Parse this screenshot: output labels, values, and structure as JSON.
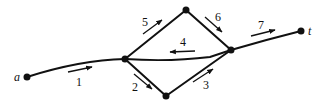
{
  "diagram": {
    "type": "directed network graph",
    "nodes": [
      {
        "id": "a",
        "label": "a",
        "x": 27,
        "y": 77
      },
      {
        "id": "n1",
        "label": "",
        "x": 125,
        "y": 59
      },
      {
        "id": "n2",
        "label": "",
        "x": 186,
        "y": 10
      },
      {
        "id": "n3",
        "label": "",
        "x": 166,
        "y": 96
      },
      {
        "id": "n4",
        "label": "",
        "x": 231,
        "y": 50
      },
      {
        "id": "t",
        "label": "t",
        "x": 301,
        "y": 31
      }
    ],
    "edges": [
      {
        "label": "1",
        "from": "a",
        "to": "n1"
      },
      {
        "label": "2",
        "from": "n1",
        "to": "n3"
      },
      {
        "label": "3",
        "from": "n3",
        "to": "n4"
      },
      {
        "label": "4",
        "from": "n4",
        "to": "n1"
      },
      {
        "label": "5",
        "from": "n1",
        "to": "n2"
      },
      {
        "label": "6",
        "from": "n2",
        "to": "n4"
      },
      {
        "label": "7",
        "from": "n4",
        "to": "t"
      }
    ],
    "colors": {
      "ink": "#111111",
      "background": "#ffffff"
    }
  }
}
